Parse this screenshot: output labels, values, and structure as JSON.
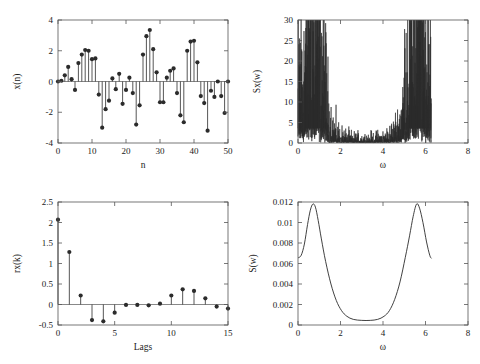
{
  "figure": {
    "background": "#ffffff",
    "ink": "#1a1a1a",
    "axis_color": "#555555",
    "marker_color": "#2b2b2b",
    "panel_count": 4
  },
  "chart_data": [
    {
      "id": "top-left",
      "type": "stem",
      "title": "",
      "xlabel": "n",
      "ylabel": "x(n)",
      "xlim": [
        0,
        50
      ],
      "ylim": [
        -4,
        4
      ],
      "xticks": [
        0,
        10,
        20,
        30,
        40,
        50
      ],
      "xticklabels": [
        "0",
        "10",
        "20",
        "30",
        "40",
        "50"
      ],
      "yticks": [
        -4,
        -2,
        0,
        2,
        4
      ],
      "yticklabels": [
        "-4",
        "-2",
        "0",
        "2",
        "4"
      ],
      "grid": false,
      "legend": "none",
      "x": [
        0,
        1,
        2,
        3,
        4,
        5,
        6,
        7,
        8,
        9,
        10,
        11,
        12,
        13,
        14,
        15,
        16,
        17,
        18,
        19,
        20,
        21,
        22,
        23,
        24,
        25,
        26,
        27,
        28,
        29,
        30,
        31,
        32,
        33,
        34,
        35,
        36,
        37,
        38,
        39,
        40,
        41,
        42,
        43,
        44,
        45,
        46,
        47,
        48,
        49,
        50
      ],
      "values": [
        0.0,
        0.05,
        0.4,
        0.95,
        0.15,
        -0.55,
        1.2,
        1.75,
        2.05,
        2.0,
        1.45,
        1.5,
        -0.85,
        -3.0,
        -1.8,
        -1.25,
        0.2,
        -0.5,
        0.5,
        -1.45,
        -0.55,
        0.25,
        -0.75,
        -2.8,
        -1.55,
        1.75,
        2.95,
        3.35,
        2.1,
        0.6,
        -1.35,
        -1.35,
        0.25,
        0.7,
        0.85,
        -0.75,
        -2.2,
        -2.65,
        2.0,
        2.6,
        2.65,
        1.25,
        -0.95,
        -1.4,
        -3.2,
        -0.6,
        -1.0,
        0.0,
        -0.95,
        -2.05,
        0.0
      ]
    },
    {
      "id": "top-right",
      "type": "line",
      "title": "",
      "xlabel": "ω",
      "ylabel": "Sx(w)",
      "xlim": [
        0,
        8
      ],
      "ylim": [
        0,
        30
      ],
      "xticks": [
        0,
        2,
        4,
        6,
        8
      ],
      "xticklabels": [
        "0",
        "2",
        "4",
        "6",
        "8"
      ],
      "yticks": [
        0,
        5,
        10,
        15,
        20,
        25,
        30
      ],
      "yticklabels": [
        "0",
        "5",
        "10",
        "15",
        "20",
        "25",
        "30"
      ],
      "grid": false,
      "legend": "none",
      "description": "Noisy periodogram over 0 to 6.28; two broad noisy lobes peaking near w=0.55 (max ~27) and w=5.72 (max ~27), secondary spikes ~17 at w=0.88 and w=5.42, near-zero floor between w=1.5 and w=4.8",
      "data_extent_x": [
        0.0,
        6.28
      ],
      "peaks": [
        {
          "x": 0.12,
          "y": 12.5
        },
        {
          "x": 0.55,
          "y": 27.1
        },
        {
          "x": 0.88,
          "y": 17.0
        },
        {
          "x": 1.15,
          "y": 11.0
        },
        {
          "x": 5.15,
          "y": 10.5
        },
        {
          "x": 5.42,
          "y": 17.0
        },
        {
          "x": 5.72,
          "y": 27.2
        },
        {
          "x": 6.15,
          "y": 12.8
        }
      ]
    },
    {
      "id": "bottom-left",
      "type": "stem",
      "title": "",
      "xlabel": "Lags",
      "ylabel": "rx(k)",
      "xlim": [
        0,
        15
      ],
      "ylim": [
        -0.5,
        2.5
      ],
      "xticks": [
        0,
        5,
        10,
        15
      ],
      "xticklabels": [
        "0",
        "5",
        "10",
        "15"
      ],
      "yticks": [
        -0.5,
        0,
        0.5,
        1,
        1.5,
        2,
        2.5
      ],
      "yticklabels": [
        "-0.5",
        "0",
        "0.5",
        "1",
        "1.5",
        "2",
        "2.5"
      ],
      "grid": false,
      "legend": "none",
      "x": [
        0,
        1,
        2,
        3,
        4,
        5,
        6,
        7,
        8,
        9,
        10,
        11,
        12,
        13,
        14,
        15
      ],
      "values": [
        2.07,
        1.28,
        0.22,
        -0.38,
        -0.41,
        -0.2,
        -0.01,
        -0.01,
        -0.02,
        0.02,
        0.22,
        0.37,
        0.33,
        0.15,
        -0.05,
        -0.1
      ]
    },
    {
      "id": "bottom-right",
      "type": "line",
      "title": "",
      "xlabel": "ω",
      "ylabel": "S(w)",
      "xlim": [
        0,
        8
      ],
      "ylim": [
        0,
        0.012
      ],
      "xticks": [
        0,
        2,
        4,
        6,
        8
      ],
      "xticklabels": [
        "0",
        "2",
        "4",
        "6",
        "8"
      ],
      "yticks": [
        0,
        0.002,
        0.004,
        0.006,
        0.008,
        0.01,
        0.012
      ],
      "yticklabels": [
        "0",
        "0.002",
        "0.004",
        "0.006",
        "0.008",
        "0.01",
        "0.012"
      ],
      "grid": false,
      "legend": "none",
      "description": "Smooth AR model spectrum over 0 to 6.28 with two symmetric peaks at w≈0.70 and w≈5.58 reaching 0.0118, valley floor 0.00045 between w≈2.6 and w≈3.7, endpoints near 0.0065",
      "data_extent_x": [
        0.0,
        6.28
      ],
      "points": [
        {
          "x": 0.0,
          "y": 0.00655
        },
        {
          "x": 0.15,
          "y": 0.0068
        },
        {
          "x": 0.3,
          "y": 0.0079
        },
        {
          "x": 0.45,
          "y": 0.0098
        },
        {
          "x": 0.58,
          "y": 0.0112
        },
        {
          "x": 0.7,
          "y": 0.0118
        },
        {
          "x": 0.82,
          "y": 0.0115
        },
        {
          "x": 0.95,
          "y": 0.0102
        },
        {
          "x": 1.1,
          "y": 0.0084
        },
        {
          "x": 1.3,
          "y": 0.0062
        },
        {
          "x": 1.55,
          "y": 0.004
        },
        {
          "x": 1.8,
          "y": 0.0024
        },
        {
          "x": 2.05,
          "y": 0.0014
        },
        {
          "x": 2.3,
          "y": 0.00085
        },
        {
          "x": 2.6,
          "y": 0.00055
        },
        {
          "x": 3.0,
          "y": 0.00045
        },
        {
          "x": 3.4,
          "y": 0.00045
        },
        {
          "x": 3.75,
          "y": 0.00055
        },
        {
          "x": 4.05,
          "y": 0.00085
        },
        {
          "x": 4.3,
          "y": 0.0014
        },
        {
          "x": 4.55,
          "y": 0.0025
        },
        {
          "x": 4.8,
          "y": 0.0042
        },
        {
          "x": 5.05,
          "y": 0.0066
        },
        {
          "x": 5.25,
          "y": 0.0087
        },
        {
          "x": 5.42,
          "y": 0.0106
        },
        {
          "x": 5.58,
          "y": 0.0118
        },
        {
          "x": 5.72,
          "y": 0.0114
        },
        {
          "x": 5.88,
          "y": 0.01
        },
        {
          "x": 6.05,
          "y": 0.0081
        },
        {
          "x": 6.2,
          "y": 0.0068
        },
        {
          "x": 6.28,
          "y": 0.0065
        }
      ]
    }
  ]
}
